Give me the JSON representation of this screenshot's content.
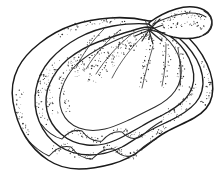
{
  "figure": {
    "style": "black ink line drawing with stipple shading",
    "orientation": "umbo at upper right, ventral margin at lower left",
    "background_color": "#ffffff",
    "ink_color": "#1a1a1a",
    "stipple_color": "#2b2b2b",
    "caption_artifact": "",
    "parts": [
      {
        "name": "umbo",
        "label": "umbo"
      },
      {
        "name": "beak",
        "label": "beak"
      },
      {
        "name": "hinge",
        "label": "hinge"
      },
      {
        "name": "growth-layers",
        "label": "concentric growth layers"
      },
      {
        "name": "ventral-margin",
        "label": "scalloped ventral margin"
      }
    ],
    "counts": {
      "growth_layers": 4,
      "margin_scallops": 7
    }
  },
  "chart_data": {
    "type": "line",
    "xlabel": "",
    "ylabel": "",
    "xlim": [
      0,
      222
    ],
    "ylim": [
      0,
      190
    ],
    "grid": false,
    "legend": "none",
    "series": [
      {
        "name": "outer-shell-outline",
        "x": [
          148,
          168,
          186,
          200,
          209,
          214,
          212,
          203,
          192,
          178,
          162,
          146,
          128,
          110,
          92,
          74,
          58,
          44,
          32,
          22,
          15,
          12,
          14,
          22,
          34,
          48,
          62,
          78,
          96,
          114,
          130,
          142,
          148
        ],
        "y": [
          20,
          22,
          30,
          44,
          62,
          80,
          98,
          112,
          122,
          130,
          138,
          148,
          156,
          162,
          166,
          168,
          166,
          160,
          150,
          136,
          120,
          104,
          88,
          74,
          62,
          52,
          44,
          36,
          28,
          22,
          18,
          18,
          20
        ]
      },
      {
        "name": "growth-ridge-1",
        "x": [
          148,
          166,
          182,
          194,
          201,
          203,
          198,
          188,
          174,
          158,
          140,
          122,
          104,
          86,
          70,
          56,
          45,
          38,
          36,
          40,
          50,
          64,
          80,
          98,
          116,
          132,
          144
        ],
        "y": [
          24,
          28,
          38,
          52,
          68,
          84,
          98,
          108,
          116,
          124,
          132,
          140,
          146,
          150,
          150,
          146,
          138,
          126,
          112,
          98,
          84,
          72,
          60,
          48,
          38,
          30,
          26
        ]
      },
      {
        "name": "growth-ridge-2",
        "x": [
          148,
          163,
          176,
          185,
          189,
          186,
          177,
          164,
          149,
          132,
          114,
          96,
          80,
          67,
          58,
          54,
          56,
          64,
          76,
          92,
          110,
          128,
          142
        ],
        "y": [
          26,
          32,
          44,
          58,
          74,
          88,
          98,
          106,
          114,
          122,
          128,
          132,
          132,
          127,
          117,
          104,
          92,
          80,
          68,
          56,
          44,
          34,
          28
        ]
      },
      {
        "name": "growth-ridge-3",
        "x": [
          148,
          160,
          170,
          175,
          175,
          169,
          158,
          145,
          130,
          113,
          97,
          84,
          75,
          72,
          74,
          82,
          94,
          108,
          124,
          138
        ],
        "y": [
          28,
          36,
          50,
          66,
          80,
          92,
          100,
          107,
          113,
          117,
          118,
          114,
          106,
          96,
          86,
          74,
          62,
          50,
          38,
          30
        ]
      },
      {
        "name": "beak-projection",
        "x": [
          150,
          162,
          176,
          190,
          201,
          208,
          211,
          208,
          200,
          188,
          174,
          160,
          150
        ],
        "y": [
          22,
          16,
          11,
          8,
          9,
          14,
          22,
          30,
          34,
          36,
          34,
          29,
          22
        ]
      }
    ],
    "annotations": [
      {
        "text": "umbo",
        "x": 150,
        "y": 24
      },
      {
        "text": "hinge rays",
        "x": 152,
        "y": 34
      }
    ]
  }
}
